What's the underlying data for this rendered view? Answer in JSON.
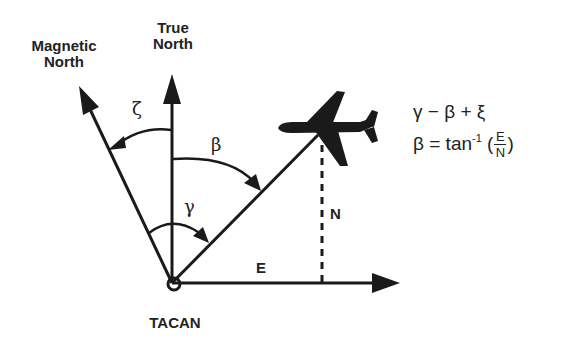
{
  "labels": {
    "magnetic_north": "Magnetic\nNorth",
    "magnetic_north_line1": "Magnetic",
    "magnetic_north_line2": "North",
    "true_north_line1": "True",
    "true_north_line2": "North",
    "station": "TACAN",
    "east_component": "E",
    "north_component": "N"
  },
  "angles": {
    "magnetic_variation": "ζ",
    "bearing_true": "β",
    "bearing_magnetic": "γ"
  },
  "equations": {
    "eq1": {
      "lhs": "γ",
      "op1": "−",
      "term2": "β",
      "op2": "+",
      "term3": "ξ"
    },
    "eq2": {
      "lhs": "β",
      "op": "=",
      "func": "tan",
      "exponent": "-1",
      "numerator": "E",
      "denominator": "N"
    }
  },
  "colors": {
    "ink": "#1a1a1a",
    "background": "#ffffff"
  }
}
